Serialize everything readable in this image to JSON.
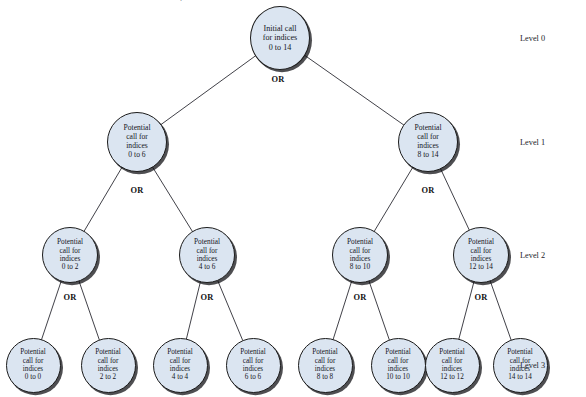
{
  "figure": {
    "type": "recursion-tree-diagram",
    "background_color": "#ffffff",
    "node_fill_color": "#dbe5f1",
    "node_border_color": "#1b1b1b",
    "edge_color": "#2b2b33",
    "text_color": "#15161c",
    "top_cut_text": "."
  },
  "branch_operator_label": "OR",
  "level_labels": [
    {
      "text": "Level 0",
      "x": 520,
      "y": 38
    },
    {
      "text": "Level 1",
      "x": 520,
      "y": 142
    },
    {
      "text": "Level 2",
      "x": 520,
      "y": 255
    },
    {
      "text": "Level 3",
      "x": 520,
      "y": 365
    }
  ],
  "or_labels": [
    {
      "text": "OR",
      "x": 278,
      "y": 79
    },
    {
      "text": "OR",
      "x": 137,
      "y": 190
    },
    {
      "text": "OR",
      "x": 428,
      "y": 190
    },
    {
      "text": "OR",
      "x": 70,
      "y": 297
    },
    {
      "text": "OR",
      "x": 207,
      "y": 297
    },
    {
      "text": "OR",
      "x": 360,
      "y": 297
    },
    {
      "text": "OR",
      "x": 481,
      "y": 297
    }
  ],
  "nodes": [
    {
      "id": "root",
      "level": 0,
      "x": 280,
      "y": 38,
      "size": "root",
      "lines": [
        "Initial call",
        "for indices",
        "0 to 14"
      ],
      "range": "0 to 14"
    },
    {
      "id": "l1-left",
      "level": 1,
      "x": 137,
      "y": 142,
      "size": "l1",
      "lines": [
        "Potential",
        "call for",
        "indices",
        "0 to 6"
      ],
      "range": "0 to 6"
    },
    {
      "id": "l1-right",
      "level": 1,
      "x": 428,
      "y": 142,
      "size": "l1",
      "lines": [
        "Potential",
        "call for",
        "indices",
        "8 to 14"
      ],
      "range": "8 to 14"
    },
    {
      "id": "l2-a",
      "level": 2,
      "x": 70,
      "y": 255,
      "size": "l2",
      "lines": [
        "Potential",
        "call for",
        "indices",
        "0 to 2"
      ],
      "range": "0 to 2"
    },
    {
      "id": "l2-b",
      "level": 2,
      "x": 207,
      "y": 255,
      "size": "l2",
      "lines": [
        "Potential",
        "call for",
        "indices",
        "4 to 6"
      ],
      "range": "4 to 6"
    },
    {
      "id": "l2-c",
      "level": 2,
      "x": 360,
      "y": 255,
      "size": "l2",
      "lines": [
        "Potential",
        "call for",
        "indices",
        "8 to 10"
      ],
      "range": "8 to 10"
    },
    {
      "id": "l2-d",
      "level": 2,
      "x": 481,
      "y": 255,
      "size": "l2",
      "lines": [
        "Potential",
        "call for",
        "indices",
        "12 to 14"
      ],
      "range": "12 to 14"
    },
    {
      "id": "l3-a",
      "level": 3,
      "x": 33,
      "y": 365,
      "size": "l3",
      "lines": [
        "Potential",
        "call for",
        "indices",
        "0 to 0"
      ],
      "range": "0 to 0"
    },
    {
      "id": "l3-b",
      "level": 3,
      "x": 108,
      "y": 365,
      "size": "l3",
      "lines": [
        "Potential",
        "call for",
        "indices",
        "2 to 2"
      ],
      "range": "2 to 2"
    },
    {
      "id": "l3-c",
      "level": 3,
      "x": 180,
      "y": 365,
      "size": "l3",
      "lines": [
        "Potential",
        "call for",
        "indices",
        "4 to 4"
      ],
      "range": "4 to 4"
    },
    {
      "id": "l3-d",
      "level": 3,
      "x": 253,
      "y": 365,
      "size": "l3",
      "lines": [
        "Potential",
        "call for",
        "indices",
        "6 to 6"
      ],
      "range": "6 to 6"
    },
    {
      "id": "l3-e",
      "level": 3,
      "x": 325,
      "y": 365,
      "size": "l3",
      "lines": [
        "Potential",
        "call for",
        "indices",
        "8 to 8"
      ],
      "range": "8 to 8"
    },
    {
      "id": "l3-f",
      "level": 3,
      "x": 398,
      "y": 365,
      "size": "l3",
      "lines": [
        "Potential",
        "call for",
        "indices",
        "10 to 10"
      ],
      "range": "10 to 10"
    },
    {
      "id": "l3-g",
      "level": 3,
      "x": 452,
      "y": 365,
      "size": "l3",
      "lines": [
        "Potential",
        "call for",
        "indices",
        "12 to 12"
      ],
      "range": "12 to 12"
    },
    {
      "id": "l3-h",
      "level": 3,
      "x": 520,
      "y": 365,
      "size": "l3",
      "lines": [
        "Potential",
        "call for",
        "indices",
        "14 to 14"
      ],
      "range": "14 to 14"
    }
  ],
  "edges": [
    {
      "from": "root",
      "to": "l1-left"
    },
    {
      "from": "root",
      "to": "l1-right"
    },
    {
      "from": "l1-left",
      "to": "l2-a"
    },
    {
      "from": "l1-left",
      "to": "l2-b"
    },
    {
      "from": "l1-right",
      "to": "l2-c"
    },
    {
      "from": "l1-right",
      "to": "l2-d"
    },
    {
      "from": "l2-a",
      "to": "l3-a"
    },
    {
      "from": "l2-a",
      "to": "l3-b"
    },
    {
      "from": "l2-b",
      "to": "l3-c"
    },
    {
      "from": "l2-b",
      "to": "l3-d"
    },
    {
      "from": "l2-c",
      "to": "l3-e"
    },
    {
      "from": "l2-c",
      "to": "l3-f"
    },
    {
      "from": "l2-d",
      "to": "l3-g"
    },
    {
      "from": "l2-d",
      "to": "l3-h"
    }
  ]
}
